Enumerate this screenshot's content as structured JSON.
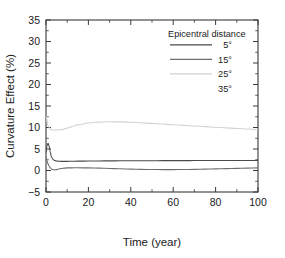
{
  "chart_data": {
    "type": "line",
    "title": "",
    "xlabel": "Time (year)",
    "ylabel": "Curvature Effect (%)",
    "xlim": [
      0,
      100
    ],
    "ylim": [
      -5,
      35
    ],
    "xticks": [
      0,
      20,
      40,
      60,
      80,
      100
    ],
    "yticks": [
      -5,
      0,
      5,
      10,
      15,
      20,
      25,
      30,
      35
    ],
    "xtick_labels": [
      "0",
      "20",
      "40",
      "60",
      "80",
      "100"
    ],
    "ytick_labels": [
      "−5",
      "0",
      "5",
      "10",
      "15",
      "20",
      "25",
      "30",
      "35"
    ],
    "grid": false,
    "legend_position": "top-right",
    "legend_title": "Epicentral distance",
    "series": [
      {
        "name": "5°",
        "color": "#4a4a4a",
        "x": [
          0,
          0.5,
          1,
          1.5,
          2,
          2.5,
          3,
          3.5,
          4,
          5,
          6,
          7,
          8,
          10,
          12,
          15,
          20,
          25,
          30,
          35,
          40,
          45,
          50,
          55,
          60,
          65,
          70,
          75,
          80,
          85,
          90,
          95,
          100
        ],
        "values": [
          4.2,
          5.9,
          6.3,
          5.6,
          4.3,
          3.3,
          2.8,
          2.5,
          2.35,
          2.2,
          2.15,
          2.13,
          2.12,
          2.13,
          2.15,
          2.17,
          2.2,
          2.22,
          2.24,
          2.25,
          2.26,
          2.27,
          2.28,
          2.29,
          2.3,
          2.3,
          2.31,
          2.31,
          2.32,
          2.32,
          2.33,
          2.33,
          2.33
        ]
      },
      {
        "name": "15°",
        "color": "#6e6e6e",
        "x": [
          0,
          0.5,
          1,
          1.5,
          2,
          2.5,
          3,
          3.5,
          4,
          5,
          6,
          7,
          8,
          10,
          12,
          15,
          20,
          25,
          30,
          35,
          40,
          45,
          50,
          55,
          60,
          65,
          70,
          75,
          80,
          85,
          90,
          95,
          100
        ],
        "values": [
          3.1,
          2.2,
          1.5,
          1.0,
          0.65,
          0.4,
          0.25,
          0.18,
          0.15,
          0.2,
          0.35,
          0.45,
          0.52,
          0.6,
          0.62,
          0.63,
          0.6,
          0.55,
          0.48,
          0.4,
          0.33,
          0.27,
          0.23,
          0.21,
          0.21,
          0.23,
          0.27,
          0.32,
          0.38,
          0.44,
          0.5,
          0.56,
          0.62
        ]
      },
      {
        "name": "25°",
        "color": "#d2d2d2",
        "x": [
          0,
          1,
          2,
          3,
          4,
          5,
          6,
          7,
          8,
          10,
          12,
          15,
          20,
          25,
          30,
          35,
          40,
          45,
          50,
          55,
          60,
          65,
          70,
          75,
          80,
          85,
          90,
          95,
          100
        ],
        "values": [
          12.6,
          10.4,
          9.6,
          9.45,
          9.42,
          9.42,
          9.45,
          9.5,
          9.6,
          9.85,
          10.15,
          10.6,
          11.05,
          11.25,
          11.32,
          11.3,
          11.22,
          11.1,
          10.95,
          10.8,
          10.65,
          10.5,
          10.35,
          10.2,
          10.05,
          9.92,
          9.78,
          9.65,
          9.5
        ]
      },
      {
        "name": "35°",
        "color": "#fbfbfb",
        "x": [
          0,
          20,
          40,
          60,
          80,
          100
        ],
        "values": [
          null,
          null,
          null,
          null,
          null,
          null
        ]
      }
    ]
  },
  "legend": {
    "title": "Epicentral distance",
    "entries": [
      {
        "label": "5°",
        "color": "#4a4a4a"
      },
      {
        "label": "15°",
        "color": "#6e6e6e"
      },
      {
        "label": "25°",
        "color": "#d2d2d2"
      },
      {
        "label": "35°",
        "color": "#fdfdfd"
      }
    ]
  },
  "axes": {
    "x_title": "Time (year)",
    "y_title": "Curvature Effect (%)"
  },
  "colors": {
    "axis": "#3a3a3a",
    "text": "#1a1a1a",
    "background": "#ffffff"
  }
}
